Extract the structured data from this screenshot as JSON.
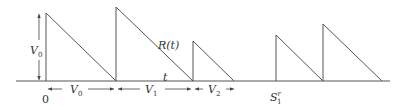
{
  "diagram": {
    "type": "sawtooth-timeline",
    "stroke_color": "#555555",
    "labels": {
      "v0_height": "V",
      "v0_height_sub": "0",
      "curve": "R(t)",
      "axis": "t",
      "origin": "0",
      "interval_0": "V",
      "interval_0_sub": "0",
      "interval_1": "V",
      "interval_1_sub": "1",
      "interval_2": "V",
      "interval_2_sub": "2",
      "event": "S",
      "event_sub": "1",
      "event_sup": "r"
    },
    "teeth": [
      {
        "start_x": 46,
        "peak_y": 13,
        "end_x": 116
      },
      {
        "start_x": 116,
        "peak_y": 7,
        "end_x": 193
      },
      {
        "start_x": 193,
        "peak_y": 41,
        "end_x": 234
      },
      {
        "start_x": 276,
        "peak_y": 35,
        "end_x": 323
      },
      {
        "start_x": 323,
        "peak_y": 24,
        "end_x": 382
      }
    ],
    "baseline_y": 81
  }
}
